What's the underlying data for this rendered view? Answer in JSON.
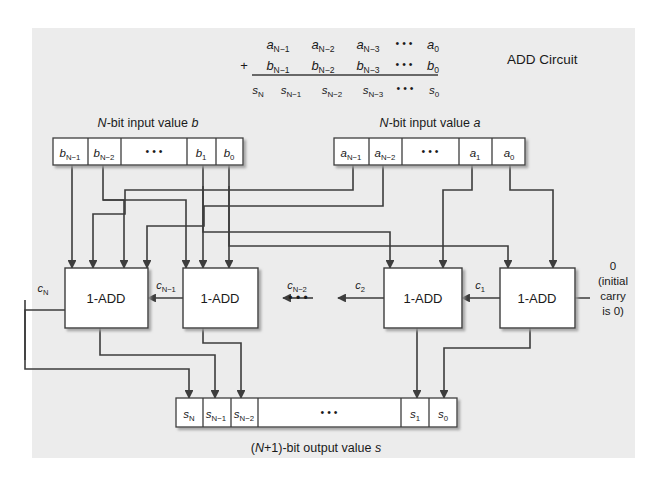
{
  "figure": {
    "title": "ADD Circuit",
    "background_color": "#ececec",
    "box_fill": "#ffffff",
    "line_color": "#3d3d3d"
  },
  "sum_table": {
    "plus_sign": "+",
    "row_a": [
      "a",
      "N−1",
      "a",
      "N−2",
      "a",
      "N−3",
      "• • •",
      "a",
      "0"
    ],
    "row_a_cells": [
      {
        "base": "a",
        "sub": "N−1"
      },
      {
        "base": "a",
        "sub": "N−2"
      },
      {
        "base": "a",
        "sub": "N−3"
      },
      {
        "base": "• • •",
        "sub": ""
      },
      {
        "base": "a",
        "sub": "0"
      }
    ],
    "row_b_cells": [
      {
        "base": "b",
        "sub": "N−1"
      },
      {
        "base": "b",
        "sub": "N−2"
      },
      {
        "base": "b",
        "sub": "N−3"
      },
      {
        "base": "• • •",
        "sub": ""
      },
      {
        "base": "b",
        "sub": "0"
      }
    ],
    "row_s_cells": [
      {
        "base": "s",
        "sub": "N"
      },
      {
        "base": "s",
        "sub": "N−1"
      },
      {
        "base": "s",
        "sub": "N−2"
      },
      {
        "base": "s",
        "sub": "N−3"
      },
      {
        "base": "• • •",
        "sub": ""
      },
      {
        "base": "s",
        "sub": "0"
      }
    ]
  },
  "input_b": {
    "caption_prefix": "N",
    "caption_suffix": "-bit input value ",
    "caption_var": "b",
    "cells": [
      {
        "base": "b",
        "sub": "N−1"
      },
      {
        "base": "b",
        "sub": "N−2"
      },
      {
        "base": "• • •",
        "sub": ""
      },
      {
        "base": "b",
        "sub": "1"
      },
      {
        "base": "b",
        "sub": "0"
      }
    ]
  },
  "input_a": {
    "caption_prefix": "N",
    "caption_suffix": "-bit input value ",
    "caption_var": "a",
    "cells": [
      {
        "base": "a",
        "sub": "N−1"
      },
      {
        "base": "a",
        "sub": "N−2"
      },
      {
        "base": "• • •",
        "sub": ""
      },
      {
        "base": "a",
        "sub": "1"
      },
      {
        "base": "a",
        "sub": "0"
      }
    ]
  },
  "adders": [
    {
      "label": "1-ADD",
      "id": "adder-n"
    },
    {
      "label": "1-ADD",
      "id": "adder-n-1"
    },
    {
      "label": "1-ADD",
      "id": "adder-2"
    },
    {
      "label": "1-ADD",
      "id": "adder-1"
    }
  ],
  "adder_ellipsis": "• • •",
  "carries": [
    {
      "base": "c",
      "sub": "N"
    },
    {
      "base": "c",
      "sub": "N−1"
    },
    {
      "base": "c",
      "sub": "N−2"
    },
    {
      "base": "c",
      "sub": "2"
    },
    {
      "base": "c",
      "sub": "1"
    }
  ],
  "initial_carry": {
    "value": "0",
    "line1": "(initial",
    "line2": "carry",
    "line3": "is 0)"
  },
  "output_s": {
    "caption": "(N+1)-bit output value s",
    "caption_parts": {
      "lead": "(",
      "n": "N",
      "mid": "+1)-bit output value ",
      "var": "s"
    },
    "cells": [
      {
        "base": "s",
        "sub": "N"
      },
      {
        "base": "s",
        "sub": "N−1"
      },
      {
        "base": "s",
        "sub": "N−2"
      },
      {
        "base": "• • •",
        "sub": ""
      },
      {
        "base": "s",
        "sub": "1"
      },
      {
        "base": "s",
        "sub": "0"
      }
    ]
  }
}
